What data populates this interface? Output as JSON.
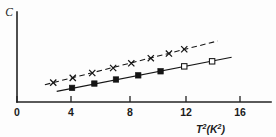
{
  "chart_data": {
    "type": "scatter",
    "title": "",
    "subtitle": "",
    "xlabel": "T² (K²)",
    "xlabel_base": "T",
    "xlabel_base_sup": "2",
    "xlabel_unit_open": "(",
    "xlabel_unit_base": "K",
    "xlabel_unit_sup": "2",
    "xlabel_unit_close": ")",
    "ylabel": "C",
    "xlim": [
      0,
      18.4
    ],
    "ylim": [
      0,
      1.0
    ],
    "grid": false,
    "legend": "none",
    "xticks": [
      0,
      4,
      8,
      12,
      16
    ],
    "xticklabels": [
      "0",
      "4",
      "8",
      "12",
      "16"
    ],
    "yticks": [],
    "yticklabels": [],
    "series": [
      {
        "name": "upper-series",
        "marker": "cross",
        "line": "dashed",
        "x": [
          2.6,
          4.0,
          5.4,
          6.9,
          8.2,
          9.6,
          10.9,
          12.0
        ],
        "y": [
          0.215,
          0.268,
          0.322,
          0.378,
          0.43,
          0.487,
          0.538,
          0.586
        ],
        "fit_x": [
          2.0,
          14.4
        ],
        "fit_y": [
          0.192,
          0.678
        ]
      },
      {
        "name": "lower-series",
        "marker": "square",
        "line": "solid",
        "x": [
          3.95,
          5.55,
          7.1,
          8.7,
          10.3,
          12.0,
          14.0
        ],
        "y": [
          0.157,
          0.205,
          0.25,
          0.296,
          0.341,
          0.396,
          0.452
        ],
        "fill": [
          "filled",
          "filled",
          "filled",
          "filled",
          "filled",
          "open",
          "open"
        ],
        "fit_x": [
          2.85,
          15.4
        ],
        "fit_y": [
          0.118,
          0.497
        ]
      }
    ]
  },
  "figure": {
    "background_color": "#fdfdfd",
    "ink_color": "#151515"
  }
}
